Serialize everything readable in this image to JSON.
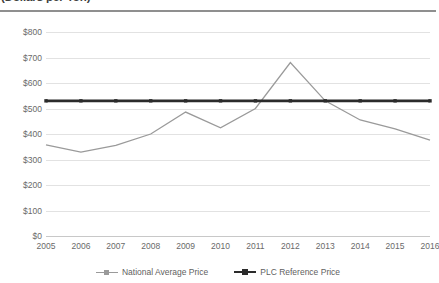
{
  "title": "(Dollars per Ton)",
  "chart_data": {
    "type": "line",
    "title": "(Dollars per Ton)",
    "xlabel": "",
    "ylabel": "",
    "ylim": [
      0,
      800
    ],
    "ytick_step": 100,
    "grid": true,
    "legend_position": "bottom",
    "categories": [
      "2005",
      "2006",
      "2007",
      "2008",
      "2009",
      "2010",
      "2011",
      "2012",
      "2013",
      "2014",
      "2015",
      "2016"
    ],
    "ytick_labels": [
      "$0",
      "$100",
      "$200",
      "$300",
      "$400",
      "$500",
      "$600",
      "$700",
      "$800"
    ],
    "ytick_values": [
      0,
      100,
      200,
      300,
      400,
      500,
      600,
      700,
      800
    ],
    "series": [
      {
        "name": "National Average Price",
        "color": "#9a9a9a",
        "marker": "none",
        "width": 1.3,
        "values": [
          357,
          329,
          355,
          400,
          486,
          424,
          500,
          680,
          530,
          455,
          420,
          376
        ]
      },
      {
        "name": "PLC Reference Price",
        "color": "#2b2b2b",
        "marker": "square",
        "width": 2.6,
        "values": [
          530,
          530,
          530,
          530,
          530,
          530,
          530,
          530,
          530,
          530,
          530,
          530
        ]
      }
    ]
  },
  "legend": {
    "items": [
      {
        "label": "National Average Price",
        "color": "#9a9a9a",
        "style": "thin"
      },
      {
        "label": "PLC Reference Price",
        "color": "#2b2b2b",
        "style": "thick"
      }
    ]
  }
}
